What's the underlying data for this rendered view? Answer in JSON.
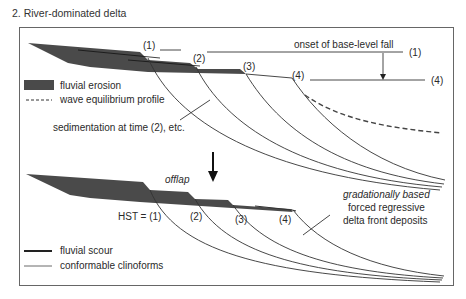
{
  "title": "2. River-dominated delta",
  "top_panel": {
    "time_labels": [
      "(1)",
      "(2)",
      "(3)",
      "(4)"
    ],
    "base_level_label": "onset of base-level fall",
    "base_level_start": "(1)",
    "base_level_end": "(4)",
    "sedimentation_label": "sedimentation at time (2), etc.",
    "legend": [
      {
        "symbol": "filled-dark-band",
        "label": "fluvial erosion"
      },
      {
        "symbol": "dashed-line",
        "label": "wave equilibrium profile"
      }
    ]
  },
  "bottom_panel": {
    "offlap_label": "offlap",
    "hst_label": "HST = (1)",
    "time_labels": [
      "(2)",
      "(3)",
      "(4)"
    ],
    "deposit_label_line1": "gradationally based",
    "deposit_label_line2": "forced regressive",
    "deposit_label_line3": "delta front deposits",
    "legend": [
      {
        "symbol": "thick-line",
        "label": "fluvial scour"
      },
      {
        "symbol": "thin-line",
        "label": "conformable clinoforms"
      }
    ]
  },
  "colors": {
    "erosion_fill": "#4a4a4a",
    "line": "#3a3a3a",
    "frame": "#555555"
  }
}
